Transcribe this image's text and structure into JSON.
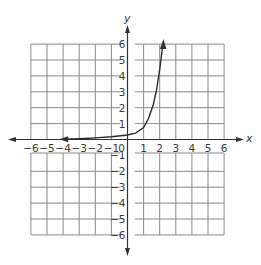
{
  "chart_data": {
    "type": "line",
    "title": "",
    "xlabel": "x",
    "ylabel": "y",
    "xlim": [
      -6,
      6
    ],
    "ylim": [
      -6,
      6
    ],
    "grid": true,
    "x_ticks": [
      "-6",
      "-5",
      "-4",
      "-3",
      "-2",
      "-1",
      "0",
      "1",
      "2",
      "3",
      "4",
      "5",
      "6"
    ],
    "y_ticks": [
      "-6",
      "-5",
      "-4",
      "-3",
      "-2",
      "-1",
      "1",
      "2",
      "3",
      "4",
      "5",
      "6"
    ],
    "series": [
      {
        "name": "exponential curve",
        "description": "Exponential growth curve with left arrow approaching y≈0 near x=-4 and upward arrow near (2.2, 6)",
        "x": [
          -4,
          -3,
          -2,
          -1,
          0,
          0.5,
          1,
          1.3,
          1.6,
          1.8,
          2.0,
          2.2
        ],
        "y": [
          0.02,
          0.05,
          0.1,
          0.17,
          0.28,
          0.4,
          0.75,
          1.3,
          2.2,
          3.1,
          4.4,
          6.0
        ]
      }
    ]
  },
  "labels": {
    "x_axis": "x",
    "y_axis": "y",
    "origin": "0"
  }
}
